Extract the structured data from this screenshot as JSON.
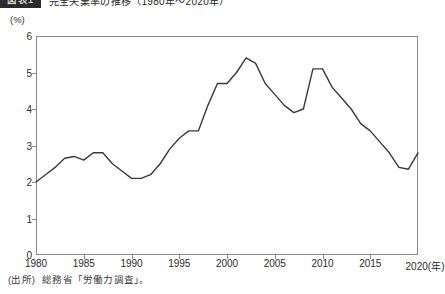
{
  "caption": {
    "badge": "図表1",
    "title": "完全失業率の推移（1980年〜2020年）"
  },
  "unit_label": "(%)",
  "source": {
    "prefix": "(出所)",
    "text": "総務省「労働力調査」。"
  },
  "colors": {
    "line": "#3a3a3a",
    "axis": "#8a8a8a",
    "text": "#2a2a2a",
    "badge_bg": "#2b2b2b",
    "background": "#ffffff"
  },
  "chart_data": {
    "type": "line",
    "title": "完全失業率の推移（1980年〜2020年）",
    "xlabel": "(年)",
    "ylabel": "(%)",
    "xlim": [
      1980,
      2020
    ],
    "ylim": [
      0,
      6
    ],
    "grid": false,
    "legend": "none",
    "x_ticks": [
      1980,
      1985,
      1990,
      1995,
      2000,
      2005,
      2010,
      2015,
      2020
    ],
    "x_tick_labels": [
      "1980",
      "1985",
      "1990",
      "1995",
      "2000",
      "2005",
      "2010",
      "2015",
      "2020"
    ],
    "x_axis_suffix": "(年)",
    "y_ticks": [
      0,
      1,
      2,
      3,
      4,
      5,
      6
    ],
    "y_tick_labels": [
      "0",
      "1",
      "2",
      "3",
      "4",
      "5",
      "6"
    ],
    "series": [
      {
        "name": "完全失業率",
        "x": [
          1980,
          1981,
          1982,
          1983,
          1984,
          1985,
          1986,
          1987,
          1988,
          1989,
          1990,
          1991,
          1992,
          1993,
          1994,
          1995,
          1996,
          1997,
          1998,
          1999,
          2000,
          2001,
          2002,
          2003,
          2004,
          2005,
          2006,
          2007,
          2008,
          2009,
          2010,
          2011,
          2012,
          2013,
          2014,
          2015,
          2016,
          2017,
          2018,
          2019,
          2020
        ],
        "values": [
          2.0,
          2.2,
          2.4,
          2.65,
          2.7,
          2.6,
          2.8,
          2.8,
          2.5,
          2.3,
          2.1,
          2.1,
          2.2,
          2.5,
          2.9,
          3.2,
          3.4,
          3.4,
          4.1,
          4.7,
          4.7,
          5.0,
          5.4,
          5.25,
          4.7,
          4.4,
          4.1,
          3.9,
          4.0,
          5.1,
          5.1,
          4.6,
          4.3,
          4.0,
          3.6,
          3.4,
          3.1,
          2.8,
          2.4,
          2.35,
          2.8
        ]
      }
    ]
  }
}
